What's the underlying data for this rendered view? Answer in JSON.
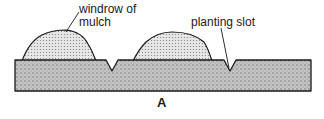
{
  "figure": {
    "caption": "A",
    "labels": {
      "windrow": "windrow of mulch",
      "slot": "planting slot"
    },
    "colors": {
      "ink": "#1a1a1a",
      "soil_fill": "#bdbdbd",
      "mulch_fill": "#d9d9d9",
      "background": "#ffffff"
    },
    "elements": [
      {
        "name": "soil-bed",
        "kind": "stippled block"
      },
      {
        "name": "windrow-1",
        "kind": "mulch mound"
      },
      {
        "name": "windrow-2",
        "kind": "mulch mound"
      },
      {
        "name": "slot-1",
        "kind": "V-notch planting slot"
      },
      {
        "name": "slot-2",
        "kind": "V-notch planting slot"
      }
    ]
  }
}
